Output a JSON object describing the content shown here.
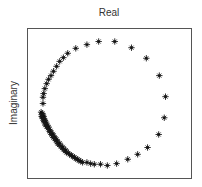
{
  "chart_data": {
    "type": "scatter",
    "title": "Real",
    "xlabel": "",
    "ylabel": "Imaginary",
    "xlim": [
      -1.23,
      1.42
    ],
    "ylim": [
      -1.21,
      1.21
    ],
    "grid": false,
    "legend": null,
    "ticks": "none",
    "marker": "*",
    "colors": {
      "marker": "#111111",
      "frame": "#555555",
      "text": "#333333"
    },
    "series": [
      {
        "name": "points",
        "points": [
          [
            -0.98,
            0.0
          ],
          [
            -0.98,
            0.1
          ],
          [
            -0.97,
            0.16
          ],
          [
            -0.95,
            0.24
          ],
          [
            -0.92,
            0.32
          ],
          [
            -0.89,
            0.39
          ],
          [
            -0.85,
            0.45
          ],
          [
            -0.81,
            0.52
          ],
          [
            -0.76,
            0.6
          ],
          [
            -0.71,
            0.68
          ],
          [
            -0.65,
            0.74
          ],
          [
            -0.58,
            0.81
          ],
          [
            -0.45,
            0.89
          ],
          [
            -0.27,
            0.95
          ],
          [
            -0.08,
            1.0
          ],
          [
            0.18,
            1.0
          ],
          [
            0.45,
            0.9
          ],
          [
            0.69,
            0.73
          ],
          [
            0.9,
            0.45
          ],
          [
            1.0,
            0.11
          ],
          [
            0.98,
            -0.23
          ],
          [
            0.89,
            -0.5
          ],
          [
            0.71,
            -0.71
          ],
          [
            0.55,
            -0.82
          ],
          [
            0.39,
            -0.9
          ],
          [
            0.21,
            -0.97
          ],
          [
            0.06,
            -1.0
          ],
          [
            -0.05,
            -0.98
          ],
          [
            -0.15,
            -0.98
          ],
          [
            -0.21,
            -0.97
          ],
          [
            -0.27,
            -0.95
          ],
          [
            -0.34,
            -0.95
          ],
          [
            -0.4,
            -0.92
          ],
          [
            -0.45,
            -0.89
          ],
          [
            -0.5,
            -0.85
          ],
          [
            -0.55,
            -0.82
          ],
          [
            -0.6,
            -0.79
          ],
          [
            -0.65,
            -0.74
          ],
          [
            -0.69,
            -0.69
          ],
          [
            -0.74,
            -0.65
          ],
          [
            -0.77,
            -0.6
          ],
          [
            -0.81,
            -0.55
          ],
          [
            -0.84,
            -0.5
          ],
          [
            -0.87,
            -0.45
          ],
          [
            -0.9,
            -0.4
          ],
          [
            -0.94,
            -0.35
          ],
          [
            -0.95,
            -0.31
          ],
          [
            -0.97,
            -0.27
          ],
          [
            -0.98,
            -0.24
          ],
          [
            -1.0,
            -0.21
          ],
          [
            -1.0,
            -0.18
          ],
          [
            -0.99,
            -0.16
          ],
          [
            -0.98,
            -0.19
          ],
          [
            -0.96,
            -0.25
          ],
          [
            -0.96,
            -0.29
          ],
          [
            -0.93,
            -0.33
          ],
          [
            -0.92,
            -0.37
          ],
          [
            -0.88,
            -0.42
          ],
          [
            -0.86,
            -0.47
          ],
          [
            -0.83,
            -0.52
          ],
          [
            -0.79,
            -0.57
          ],
          [
            -0.75,
            -0.62
          ],
          [
            -0.72,
            -0.67
          ],
          [
            -0.67,
            -0.72
          ],
          [
            -0.62,
            -0.77
          ],
          [
            -0.57,
            -0.8
          ],
          [
            -0.52,
            -0.84
          ],
          [
            -0.47,
            -0.87
          ],
          [
            -0.42,
            -0.9
          ],
          [
            -0.37,
            -0.93
          ],
          [
            -1.01,
            -0.14
          ],
          [
            -0.99,
            -0.22
          ],
          [
            -0.97,
            -0.21
          ],
          [
            -0.95,
            -0.27
          ],
          [
            -0.93,
            -0.3
          ],
          [
            -0.91,
            -0.35
          ],
          [
            -0.89,
            -0.38
          ],
          [
            -0.86,
            -0.44
          ],
          [
            -0.82,
            -0.49
          ],
          [
            -0.79,
            -0.54
          ],
          [
            -0.76,
            -0.58
          ],
          [
            -0.71,
            -0.64
          ],
          [
            -0.66,
            -0.7
          ],
          [
            -0.61,
            -0.75
          ]
        ]
      }
    ]
  }
}
